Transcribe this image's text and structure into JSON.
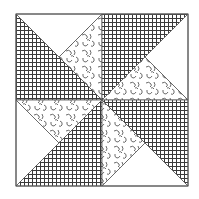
{
  "block": {
    "x0": 16,
    "y0": 14,
    "x1": 188,
    "y1": 186,
    "cx": 102,
    "cy": 100,
    "border_color": "#555555",
    "grid_color": "#3a3a3a",
    "grid_spacing": 4,
    "swirl_color": "#444444",
    "background": "#ffffff"
  },
  "fabrics": [
    "grid-crosshatch",
    "swirl-print",
    "plain-white"
  ],
  "pieces": [
    {
      "quadrant": "top-left",
      "fabric": "grid",
      "points": [
        [
          16,
          14
        ],
        [
          16,
          100
        ],
        [
          102,
          100
        ]
      ]
    },
    {
      "quadrant": "top-left",
      "fabric": "white",
      "points": [
        [
          16,
          14
        ],
        [
          102,
          14
        ],
        [
          59,
          57
        ]
      ]
    },
    {
      "quadrant": "top-left",
      "fabric": "swirl",
      "points": [
        [
          102,
          14
        ],
        [
          102,
          100
        ],
        [
          59,
          57
        ]
      ]
    },
    {
      "quadrant": "top-right",
      "fabric": "grid",
      "points": [
        [
          102,
          14
        ],
        [
          188,
          14
        ],
        [
          102,
          100
        ]
      ]
    },
    {
      "quadrant": "top-right",
      "fabric": "white",
      "points": [
        [
          188,
          14
        ],
        [
          188,
          100
        ],
        [
          145,
          57
        ]
      ]
    },
    {
      "quadrant": "top-right",
      "fabric": "swirl",
      "points": [
        [
          102,
          100
        ],
        [
          188,
          100
        ],
        [
          145,
          57
        ]
      ]
    },
    {
      "quadrant": "bottom-left",
      "fabric": "swirl",
      "points": [
        [
          16,
          100
        ],
        [
          102,
          100
        ],
        [
          59,
          143
        ]
      ]
    },
    {
      "quadrant": "bottom-left",
      "fabric": "white",
      "points": [
        [
          16,
          100
        ],
        [
          16,
          186
        ],
        [
          59,
          143
        ]
      ]
    },
    {
      "quadrant": "bottom-left",
      "fabric": "grid",
      "points": [
        [
          16,
          186
        ],
        [
          102,
          186
        ],
        [
          102,
          100
        ]
      ]
    },
    {
      "quadrant": "bottom-right",
      "fabric": "grid",
      "points": [
        [
          102,
          100
        ],
        [
          188,
          100
        ],
        [
          188,
          186
        ]
      ]
    },
    {
      "quadrant": "bottom-right",
      "fabric": "swirl",
      "points": [
        [
          102,
          100
        ],
        [
          102,
          186
        ],
        [
          145,
          143
        ]
      ]
    },
    {
      "quadrant": "bottom-right",
      "fabric": "white",
      "points": [
        [
          102,
          186
        ],
        [
          188,
          186
        ],
        [
          145,
          143
        ]
      ]
    }
  ]
}
